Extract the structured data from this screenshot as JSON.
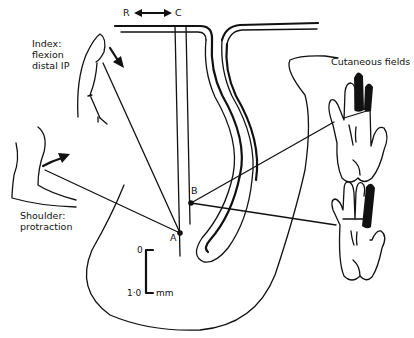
{
  "figure": {
    "labels": {
      "direction_left": "R",
      "direction_right": "C",
      "index_line1": "Index:",
      "index_line2": "flexion",
      "index_line3": "distal IP",
      "shoulder_line1": "Shoulder:",
      "shoulder_line2": "protraction",
      "cutaneous": "Cutaneous fields",
      "point_a": "A",
      "point_b": "B",
      "scale_top": "0",
      "scale_bottom": "1·0",
      "scale_unit": "mm"
    },
    "colors": {
      "ink": "#111111",
      "background": "#ffffff"
    }
  }
}
